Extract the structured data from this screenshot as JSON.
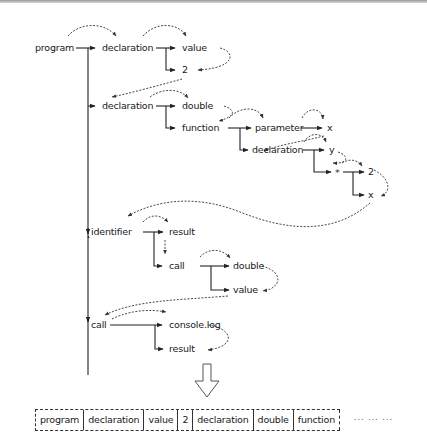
{
  "diagram": {
    "nodes": {
      "program": "program",
      "declaration1": "declaration",
      "value1": "value",
      "two1": "2",
      "declaration2": "declaration",
      "double1": "double",
      "function": "function",
      "parameter": "parameter",
      "x1": "x",
      "declaration3": "declaration",
      "y": "y",
      "star": "*",
      "two2": "2",
      "x2": "x",
      "identifier": "identifier",
      "result1": "result",
      "call1": "call",
      "double2": "double",
      "value2": "value",
      "call2": "call",
      "consolelog": "console.log",
      "result2": "result"
    },
    "edges": [
      [
        "program",
        "declaration1"
      ],
      [
        "program",
        "declaration2"
      ],
      [
        "program",
        "identifier"
      ],
      [
        "program",
        "call2"
      ],
      [
        "declaration1",
        "value1"
      ],
      [
        "declaration1",
        "two1"
      ],
      [
        "declaration2",
        "double1"
      ],
      [
        "declaration2",
        "function"
      ],
      [
        "function",
        "parameter"
      ],
      [
        "function",
        "declaration3"
      ],
      [
        "parameter",
        "x1"
      ],
      [
        "declaration3",
        "y"
      ],
      [
        "declaration3",
        "star"
      ],
      [
        "star",
        "two2"
      ],
      [
        "star",
        "x2"
      ],
      [
        "identifier",
        "result1"
      ],
      [
        "identifier",
        "call1"
      ],
      [
        "call1",
        "double2"
      ],
      [
        "call1",
        "value2"
      ],
      [
        "call2",
        "consolelog"
      ],
      [
        "call2",
        "result2"
      ]
    ],
    "traversal_style": "dashed curved arrows",
    "transform_arrow": "down-arrow"
  },
  "sequence": {
    "cells": [
      "program",
      "declaration",
      "value",
      "2",
      "declaration",
      "double",
      "function"
    ],
    "ellipsis": "... ... ..."
  },
  "colors": {
    "ink": "#1a1a1a",
    "dashed": "#333333",
    "background": "#ffffff"
  }
}
